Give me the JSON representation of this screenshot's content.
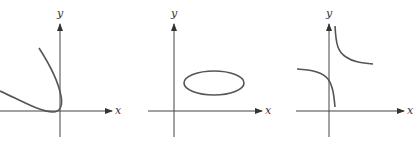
{
  "figure": {
    "panels": [
      {
        "id": "a",
        "x_label": "x",
        "y_label": "y",
        "curve": "parabola-like curve opening left, tangent to x-axis near origin"
      },
      {
        "id": "b",
        "x_label": "x",
        "y_label": "y",
        "curve": "ellipse in first quadrant"
      },
      {
        "id": "c",
        "x_label": "x",
        "y_label": "y",
        "curve": "hyperbola-like curve with vertical asymptote just right of y-axis"
      }
    ]
  },
  "colors": {
    "axis": "#444444",
    "curve": "#555555",
    "background": "#ffffff"
  }
}
